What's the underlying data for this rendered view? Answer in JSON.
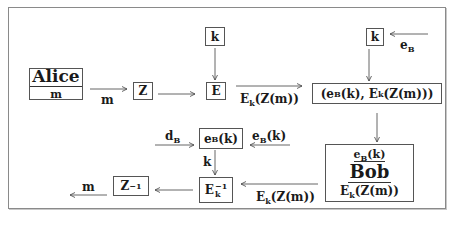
{
  "diagram": {
    "title": "",
    "nodes": {
      "alice": {
        "name": "Alice",
        "sub": "m"
      },
      "z": {
        "label": "Z"
      },
      "k_top": {
        "label": "k"
      },
      "e": {
        "label": "E"
      },
      "pair": {
        "label": "(eB(k), Ek(Z(m)))",
        "p1": "(e",
        "p1_sub": "B",
        "p2": "(k), E",
        "p2_sub": "k",
        "p3": "(Z(m)))"
      },
      "k_right": {
        "label": "k"
      },
      "bob": {
        "name": "Bob",
        "top": "eB(k)",
        "top_main": "e",
        "top_sub": "B",
        "top_rest": "(k)",
        "bottom_main": "E",
        "bottom_sub": "k",
        "bottom_rest": "(Z(m))"
      },
      "eb_k": {
        "main": "e",
        "sub": "B",
        "rest": "(k)"
      },
      "e_inv": {
        "main": "E",
        "sup": "−1",
        "sub": "k"
      },
      "z_inv": {
        "main": "Z",
        "sup": "−1"
      }
    },
    "edges": [
      {
        "from": "alice",
        "to": "z",
        "label": "m"
      },
      {
        "from": "z",
        "to": "e",
        "label": ""
      },
      {
        "from": "k_top",
        "to": "e",
        "label": ""
      },
      {
        "from": "e",
        "to": "pair",
        "label": "Ek(Z(m))",
        "label_main": "E",
        "label_sub": "k",
        "label_rest": "(Z(m))"
      },
      {
        "from": "external",
        "to": "k_right",
        "label": "eB",
        "label_main": "e",
        "label_sub": "B"
      },
      {
        "from": "k_right",
        "to": "pair",
        "label": ""
      },
      {
        "from": "pair",
        "to": "bob",
        "label": ""
      },
      {
        "from": "bob",
        "to": "e_inv",
        "label": "Ek(Z(m))",
        "label_main": "E",
        "label_sub": "k",
        "label_rest": "(Z(m))"
      },
      {
        "from": "external",
        "to": "eb_k",
        "label": "eB(k)",
        "label_main": "e",
        "label_sub": "B",
        "label_rest": "(k)"
      },
      {
        "from": "external",
        "to": "eb_k",
        "label": "dB",
        "label_main": "d",
        "label_sub": "B"
      },
      {
        "from": "eb_k",
        "to": "e_inv",
        "label": "k"
      },
      {
        "from": "e_inv",
        "to": "z_inv",
        "label": ""
      },
      {
        "from": "z_inv",
        "to": "external",
        "label": "m"
      }
    ]
  }
}
